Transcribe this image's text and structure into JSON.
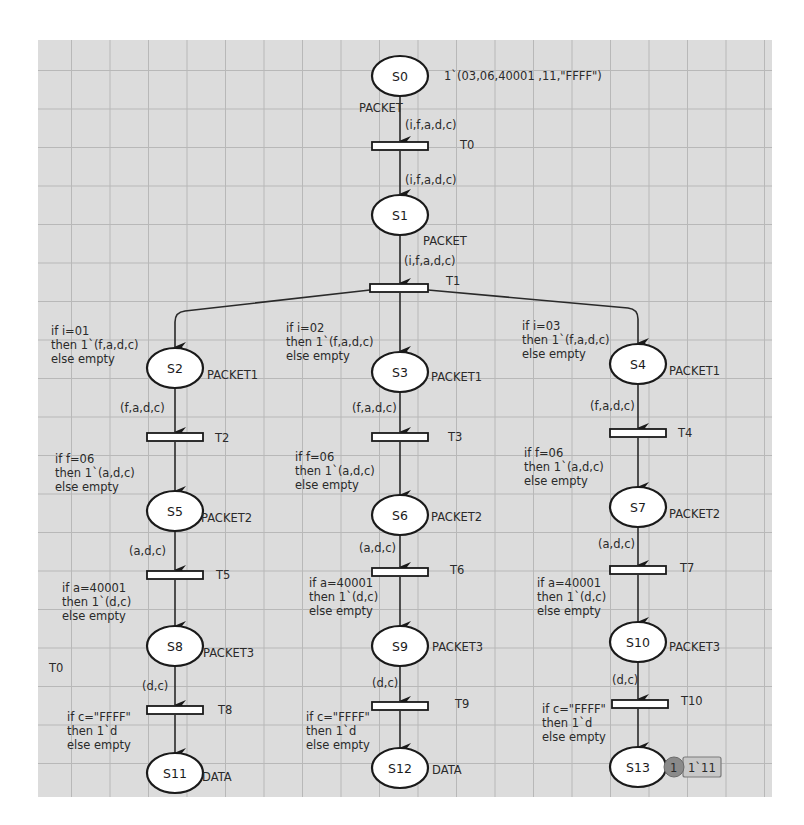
{
  "diagram": {
    "type": "colored-petri-net",
    "places": [
      {
        "id": "S0",
        "label": "S0",
        "colorset": "PACKET",
        "initial_marking": "1`(03,06,40001 ,11,\"FFFF\")"
      },
      {
        "id": "S1",
        "label": "S1",
        "colorset": "PACKET"
      },
      {
        "id": "S2",
        "label": "S2",
        "colorset": "PACKET1"
      },
      {
        "id": "S3",
        "label": "S3",
        "colorset": "PACKET1"
      },
      {
        "id": "S4",
        "label": "S4",
        "colorset": "PACKET1"
      },
      {
        "id": "S5",
        "label": "S5",
        "colorset": "PACKET2"
      },
      {
        "id": "S6",
        "label": "S6",
        "colorset": "PACKET2"
      },
      {
        "id": "S7",
        "label": "S7",
        "colorset": "PACKET2"
      },
      {
        "id": "S8",
        "label": "S8",
        "colorset": "PACKET3"
      },
      {
        "id": "S9",
        "label": "S9",
        "colorset": "PACKET3"
      },
      {
        "id": "S10",
        "label": "S10",
        "colorset": "PACKET3"
      },
      {
        "id": "S11",
        "label": "S11",
        "colorset": "DATA"
      },
      {
        "id": "S12",
        "label": "S12",
        "colorset": "DATA"
      },
      {
        "id": "S13",
        "label": "S13",
        "colorset": "",
        "token_count": "1",
        "current_marking": "1`11"
      }
    ],
    "transitions": [
      {
        "id": "T0",
        "label": "T0"
      },
      {
        "id": "T1",
        "label": "T1"
      },
      {
        "id": "T2",
        "label": "T2"
      },
      {
        "id": "T3",
        "label": "T3"
      },
      {
        "id": "T4",
        "label": "T4"
      },
      {
        "id": "T5",
        "label": "T5"
      },
      {
        "id": "T6",
        "label": "T6"
      },
      {
        "id": "T7",
        "label": "T7"
      },
      {
        "id": "T8",
        "label": "T8"
      },
      {
        "id": "T9",
        "label": "T9"
      },
      {
        "id": "T10",
        "label": "T10"
      }
    ],
    "arc_inscriptions": {
      "s0_t0": "(i,f,a,d,c)",
      "t0_s1": "(i,f,a,d,c)",
      "s1_t1": "(i,f,a,d,c)",
      "t1_s2": [
        "if i=01",
        "then 1`(f,a,d,c)",
        "else empty"
      ],
      "t1_s3": [
        "if i=02",
        "then 1`(f,a,d,c)",
        "else empty"
      ],
      "t1_s4": [
        "if i=03",
        "then 1`(f,a,d,c)",
        "else empty"
      ],
      "s2_t2": "(f,a,d,c)",
      "s3_t3": "(f,a,d,c)",
      "s4_t4": "(f,a,d,c)",
      "t2_s5": [
        "if f=06",
        "then 1`(a,d,c)",
        "else empty"
      ],
      "t3_s6": [
        "if f=06",
        "then 1`(a,d,c)",
        "else empty"
      ],
      "t4_s7": [
        "if f=06",
        "then 1`(a,d,c)",
        "else empty"
      ],
      "s5_t5": "(a,d,c)",
      "s6_t6": "(a,d,c)",
      "s7_t7": "(a,d,c)",
      "t5_s8": [
        "if  a=40001",
        "then 1`(d,c)",
        "else empty"
      ],
      "t6_s9": [
        "if a=40001",
        "then 1`(d,c)",
        "else empty"
      ],
      "t7_s10": [
        "if a=40001",
        "then 1`(d,c)",
        "else empty"
      ],
      "s8_t8": "(d,c)",
      "s9_t9": "(d,c)",
      "s10_t10": "(d,c)",
      "t8_s11": [
        "if c=\"FFFF\"",
        "then 1`d",
        "else empty"
      ],
      "t9_s12": [
        "if c=\"FFFF\"",
        "then 1`d",
        "else empty"
      ],
      "t10_s13": [
        "if c=\"FFFF\"",
        "then 1`d",
        "else empty"
      ]
    },
    "stray_label": "T0"
  }
}
